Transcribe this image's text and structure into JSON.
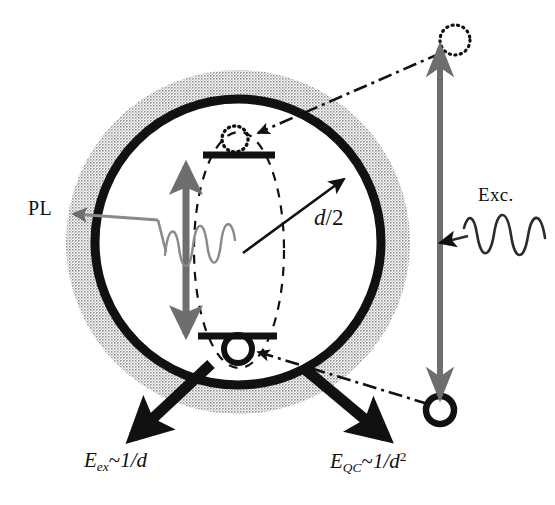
{
  "figure": {
    "canvas": {
      "width": 555,
      "height": 505,
      "background": "#ffffff"
    }
  },
  "colors": {
    "ink": "#111111",
    "halo_gray": "#9a9a9a",
    "arrow_gray": "#6e6e6e",
    "pl_wave_gray": "#8a8a8a",
    "white": "#ffffff"
  },
  "labels": {
    "pl": "PL",
    "excitation": "Exc.",
    "radius": {
      "symbol": "d",
      "rest": "/2",
      "full": "d/2"
    },
    "exciton_energy": {
      "base": "E",
      "subscript": "ex",
      "relation": "~",
      "expression": "1/d",
      "full": "E_ex ~ 1/d"
    },
    "quantum_confinement_energy": {
      "base": "E",
      "subscript": "QC",
      "relation": "~",
      "expression": "1/d",
      "exponent": "2",
      "full": "E_QC ~ 1/d^2"
    }
  },
  "geometry": {
    "particle": {
      "cx": 238,
      "cy": 242,
      "r_core": 143,
      "r_halo": 172,
      "core_stroke_width": 9
    },
    "exciton_ellipse": {
      "cx": 239,
      "cy": 250,
      "rx": 45,
      "ry": 118
    },
    "levels": {
      "upper": {
        "x1": 203,
        "x2": 275,
        "y": 155,
        "thickness": 7
      },
      "lower": {
        "x1": 198,
        "x2": 277,
        "y": 336,
        "thickness": 7
      }
    },
    "inner_gap_arrow": {
      "x": 186,
      "y_top": 160,
      "y_bottom": 340
    },
    "outer_gap_arrow": {
      "x": 440,
      "y_top": 40,
      "y_bottom": 408
    },
    "free_electron": {
      "cx": 455,
      "cy": 40,
      "r": 15,
      "style": "dotted"
    },
    "free_hole": {
      "cx": 440,
      "cy": 410,
      "r": 14,
      "style": "solid-ring"
    },
    "bound_electron": {
      "cx": 235,
      "cy": 139,
      "r": 13,
      "style": "dotted"
    },
    "bound_hole": {
      "cx": 238,
      "cy": 349,
      "r": 15,
      "style": "solid-ring"
    },
    "radius_arrow": {
      "x1": 243,
      "y1": 253,
      "x2": 348,
      "y2": 176
    },
    "eex_arrow": {
      "x1": 207,
      "y1": 368,
      "x2": 131,
      "y2": 440
    },
    "eqc_arrow": {
      "x1": 310,
      "y1": 372,
      "x2": 388,
      "y2": 440
    }
  },
  "elements": {
    "particle_core": "quantum-dot-core-circle",
    "particle_halo": "quantum-dot-halo",
    "exciton_envelope": "exciton-wavefunction-ellipse",
    "upper_level": "conduction-band-level",
    "lower_level": "valence-band-level",
    "pl_wave": "photoluminescence-wave",
    "exc_wave": "excitation-wave"
  }
}
